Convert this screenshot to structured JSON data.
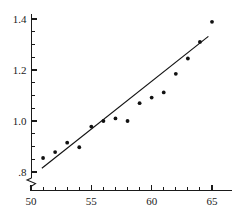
{
  "chart_data": {
    "type": "scatter",
    "title": "",
    "subtitle": "",
    "xlabel": "",
    "ylabel": "",
    "xlim": [
      50,
      65.6
    ],
    "ylim": [
      0.78,
      1.425
    ],
    "grid": false,
    "legend": null,
    "x_ticks_major": [
      50,
      55,
      60,
      65
    ],
    "x_tick_labels": [
      "50",
      "55",
      "60",
      "65"
    ],
    "x_ticks_minor": [
      51,
      52,
      53,
      54,
      56,
      57,
      58,
      59,
      61,
      62,
      63,
      64
    ],
    "y_ticks_major": [
      0.8,
      1.0,
      1.2,
      1.4
    ],
    "y_tick_labels": [
      ".8",
      "1.0",
      "1.2",
      "1.4"
    ],
    "y_ticks_minor": [
      0.85,
      0.9,
      0.95,
      1.05,
      1.1,
      1.15,
      1.25,
      1.3,
      1.35
    ],
    "y_axis_break": true,
    "y_axis_break_note": "zigzag break symbol below .8 on the vertical axis",
    "point_color": "#111111",
    "line_color": "#111111",
    "axis_color": "#1a1a1a",
    "background_color": "#ffffff",
    "x": [
      51,
      52,
      53,
      54,
      55,
      56,
      57,
      58,
      59,
      60,
      61,
      62,
      63,
      64,
      65
    ],
    "y": [
      0.855,
      0.878,
      0.915,
      0.897,
      0.978,
      1.0,
      1.01,
      1.0,
      1.07,
      1.092,
      1.112,
      1.185,
      1.245,
      1.31,
      1.389
    ],
    "series": [
      {
        "name": "observations",
        "type": "scatter",
        "x": [
          51,
          52,
          53,
          54,
          55,
          56,
          57,
          58,
          59,
          60,
          61,
          62,
          63,
          64,
          65
        ],
        "values": [
          0.855,
          0.878,
          0.915,
          0.897,
          0.978,
          1.0,
          1.01,
          1.0,
          1.07,
          1.092,
          1.112,
          1.185,
          1.245,
          1.31,
          1.389
        ]
      },
      {
        "name": "fitted-line",
        "type": "line",
        "x": [
          50.9,
          64.7
        ],
        "values": [
          0.815,
          1.332
        ]
      }
    ]
  }
}
